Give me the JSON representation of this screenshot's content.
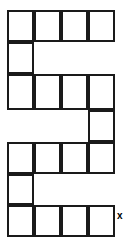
{
  "figure": {
    "kind": "polyomino-net-diagram",
    "stroke_color": "#1a1a1a",
    "fill_color": "#ffffff",
    "background_color": "#ffffff",
    "stroke_width_px": 2,
    "cell_size_px": 27,
    "origin_x_px": 7,
    "origin_y_px": 10,
    "columns": 4,
    "rows": 7,
    "total_cells": 18,
    "rows_layout": [
      {
        "row": 1,
        "filled_columns": [
          1,
          2,
          3,
          4
        ]
      },
      {
        "row": 2,
        "filled_columns": [
          1
        ]
      },
      {
        "row": 3,
        "filled_columns": [
          1,
          2,
          3,
          4
        ]
      },
      {
        "row": 4,
        "filled_columns": [
          4
        ]
      },
      {
        "row": 5,
        "filled_columns": [
          1,
          2,
          3,
          4
        ]
      },
      {
        "row": 6,
        "filled_columns": [
          1
        ]
      },
      {
        "row": 7,
        "filled_columns": [
          1,
          2,
          3,
          4
        ]
      }
    ],
    "cells": [
      {
        "id": "r1c1",
        "row": 1,
        "col": 1,
        "x": 7,
        "y": 10,
        "w": 27,
        "h": 32
      },
      {
        "id": "r1c2",
        "row": 1,
        "col": 2,
        "x": 34,
        "y": 10,
        "w": 27,
        "h": 32
      },
      {
        "id": "r1c3",
        "row": 1,
        "col": 3,
        "x": 61,
        "y": 10,
        "w": 27,
        "h": 32
      },
      {
        "id": "r1c4",
        "row": 1,
        "col": 4,
        "x": 88,
        "y": 10,
        "w": 27,
        "h": 32
      },
      {
        "id": "r2c1",
        "row": 2,
        "col": 1,
        "x": 7,
        "y": 42,
        "w": 27,
        "h": 32
      },
      {
        "id": "r3c1",
        "row": 3,
        "col": 1,
        "x": 7,
        "y": 74,
        "w": 27,
        "h": 36
      },
      {
        "id": "r3c2",
        "row": 3,
        "col": 2,
        "x": 34,
        "y": 74,
        "w": 27,
        "h": 36
      },
      {
        "id": "r3c3",
        "row": 3,
        "col": 3,
        "x": 61,
        "y": 74,
        "w": 27,
        "h": 36
      },
      {
        "id": "r3c4",
        "row": 3,
        "col": 4,
        "x": 88,
        "y": 74,
        "w": 27,
        "h": 36
      },
      {
        "id": "r4c4",
        "row": 4,
        "col": 4,
        "x": 88,
        "y": 110,
        "w": 27,
        "h": 32
      },
      {
        "id": "r5c1",
        "row": 5,
        "col": 1,
        "x": 7,
        "y": 142,
        "w": 27,
        "h": 32
      },
      {
        "id": "r5c2",
        "row": 5,
        "col": 2,
        "x": 34,
        "y": 142,
        "w": 27,
        "h": 32
      },
      {
        "id": "r5c3",
        "row": 5,
        "col": 3,
        "x": 61,
        "y": 142,
        "w": 27,
        "h": 32
      },
      {
        "id": "r5c4",
        "row": 5,
        "col": 4,
        "x": 88,
        "y": 142,
        "w": 27,
        "h": 32
      },
      {
        "id": "r6c1",
        "row": 6,
        "col": 1,
        "x": 7,
        "y": 174,
        "w": 27,
        "h": 31
      },
      {
        "id": "r7c1",
        "row": 7,
        "col": 1,
        "x": 7,
        "y": 205,
        "w": 27,
        "h": 32
      },
      {
        "id": "r7c2",
        "row": 7,
        "col": 2,
        "x": 34,
        "y": 205,
        "w": 27,
        "h": 32
      },
      {
        "id": "r7c3",
        "row": 7,
        "col": 3,
        "x": 61,
        "y": 205,
        "w": 27,
        "h": 32
      },
      {
        "id": "r7c4",
        "row": 7,
        "col": 4,
        "x": 88,
        "y": 205,
        "w": 27,
        "h": 32
      }
    ],
    "labels": [
      {
        "id": "label-x",
        "text": "x",
        "x": 117,
        "y": 211,
        "anchor": "bottom-right-of-figure",
        "color": "#000000"
      }
    ]
  }
}
